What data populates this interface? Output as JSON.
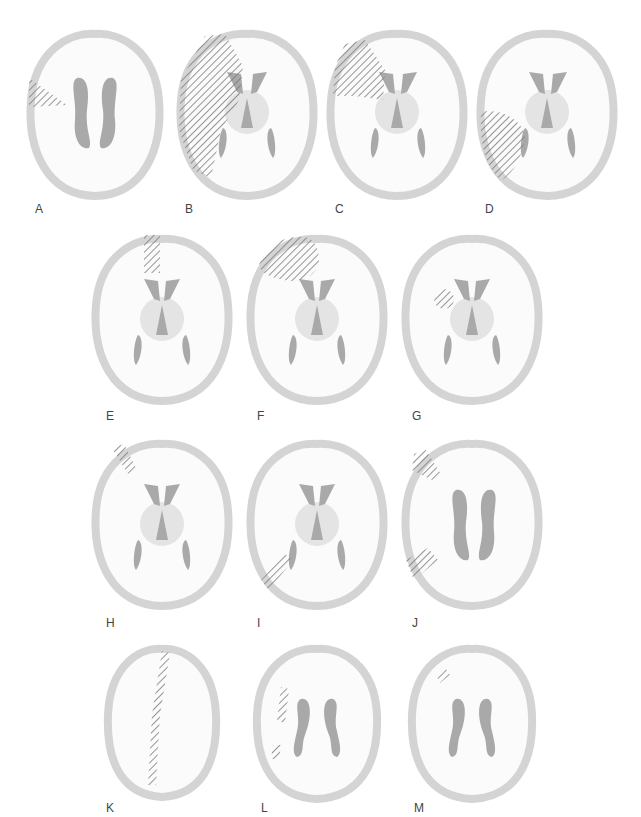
{
  "figure": {
    "colors": {
      "background": "#ffffff",
      "brain_fill": "#fbfbfb",
      "cortex_rim": "#d4d4d4",
      "ventricle": "#a9a9a9",
      "thalamus": "#e4e4e4",
      "hatch": "#7a7a7a"
    },
    "panels": [
      {
        "label": "A",
        "slice": "ventricle-body",
        "lesion": "left lateral frontal wedge"
      },
      {
        "label": "B",
        "slice": "basal-ganglia",
        "lesion": "large left frontotemporoparietal"
      },
      {
        "label": "C",
        "slice": "basal-ganglia",
        "lesion": "left frontal"
      },
      {
        "label": "D",
        "slice": "basal-ganglia",
        "lesion": "left temporal"
      },
      {
        "label": "E",
        "slice": "basal-ganglia",
        "lesion": "medial frontal strip"
      },
      {
        "label": "F",
        "slice": "basal-ganglia",
        "lesion": "left frontal pole"
      },
      {
        "label": "G",
        "slice": "basal-ganglia",
        "lesion": "left deep insular/putaminal"
      },
      {
        "label": "H",
        "slice": "basal-ganglia",
        "lesion": "left anterior frontal strip"
      },
      {
        "label": "I",
        "slice": "basal-ganglia",
        "lesion": "left posterior temporal"
      },
      {
        "label": "J",
        "slice": "ventricle-body",
        "lesion": "left frontal and posterior"
      },
      {
        "label": "K",
        "slice": "vertex",
        "lesion": "parasagittal strip"
      },
      {
        "label": "L",
        "slice": "high-ventricle",
        "lesion": "left periventricular"
      },
      {
        "label": "M",
        "slice": "high-ventricle",
        "lesion": "small left frontal"
      }
    ]
  }
}
